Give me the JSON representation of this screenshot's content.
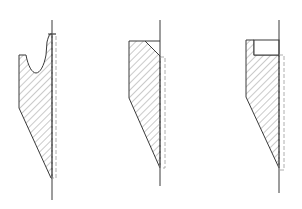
{
  "diagram": {
    "colors": {
      "line": "#3a3a3a",
      "hatch": "#7a7a7a",
      "dashed": "#9a9a9a",
      "background": "#ffffff"
    },
    "figures": [
      {
        "id": "profile-1",
        "feature": "U-shaped groove at top with thin lip"
      },
      {
        "id": "profile-2",
        "feature": "chamfered top corner"
      },
      {
        "id": "profile-3",
        "feature": "rectangular step notch at top"
      }
    ]
  }
}
